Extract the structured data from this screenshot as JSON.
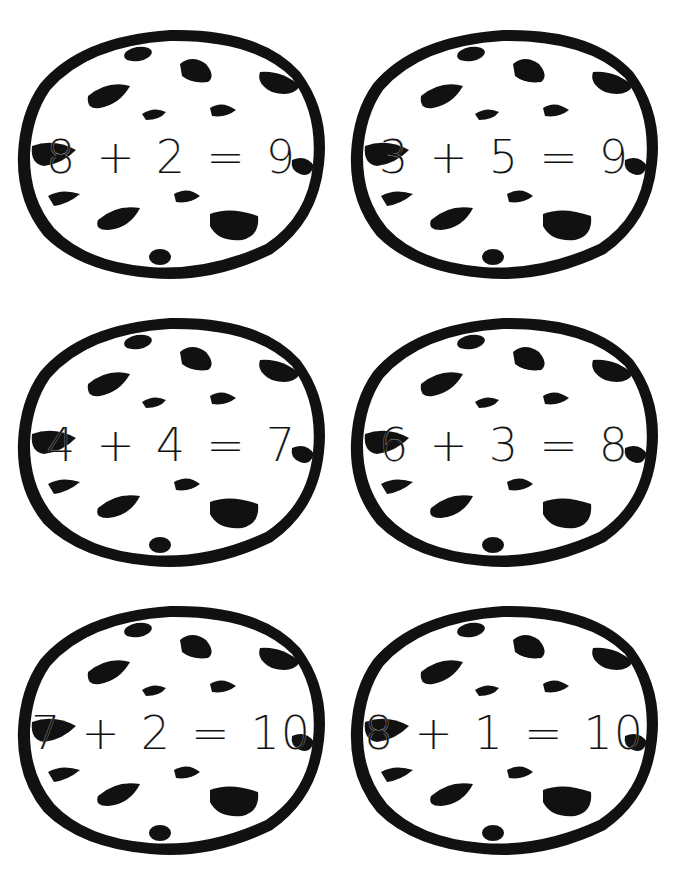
{
  "worksheet": {
    "cookies": [
      {
        "a": "8",
        "op": "+",
        "b": "2",
        "eq": "=",
        "result": "9"
      },
      {
        "a": "3",
        "op": "+",
        "b": "5",
        "eq": "=",
        "result": "9"
      },
      {
        "a": "4",
        "op": "+",
        "b": "4",
        "eq": "=",
        "result": "7"
      },
      {
        "a": "6",
        "op": "+",
        "b": "3",
        "eq": "=",
        "result": "8"
      },
      {
        "a": "7",
        "op": "+",
        "b": "2",
        "eq": "=",
        "result": "10"
      },
      {
        "a": "8",
        "op": "+",
        "b": "1",
        "eq": "=",
        "result": "10"
      }
    ],
    "colors": {
      "ink": "#111111",
      "paper": "#ffffff"
    }
  }
}
